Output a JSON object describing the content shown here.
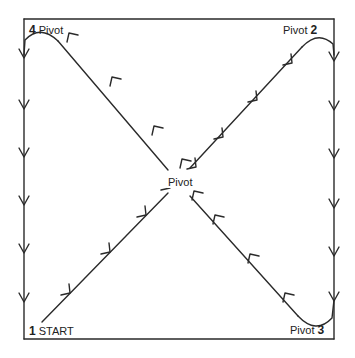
{
  "diagram": {
    "title": "",
    "labels": {
      "corner1_num": "1",
      "corner1_text": "START",
      "corner2_num": "2",
      "corner2_text": "Pivot",
      "corner3_num": "3",
      "corner3_text": "Pivot",
      "corner4_num": "4",
      "corner4_text": "Pivot",
      "center_text": "Pivot"
    },
    "path_order": [
      "1 START",
      "Center Pivot",
      "2 Pivot",
      "3 Pivot",
      "Center Pivot",
      "4 Pivot",
      "1 START"
    ],
    "colors": {
      "line": "#2a2a2a",
      "background": "#ffffff"
    }
  }
}
